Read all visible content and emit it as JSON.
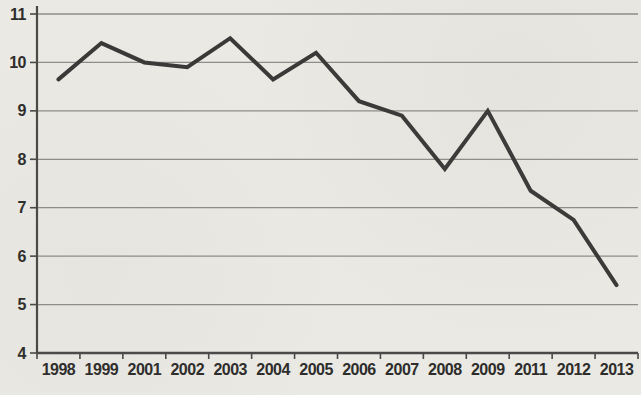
{
  "figure": {
    "background_color": "#eae9e4",
    "gridline_color": "#8e8d89",
    "axis_color": "#4a4947",
    "tick_text_color": "#2e2d2b"
  },
  "chart_data": {
    "type": "line",
    "title": "",
    "xlabel": "",
    "ylabel": "",
    "categories": [
      "1998",
      "1999",
      "2001",
      "2002",
      "2003",
      "2004",
      "2005",
      "2006",
      "2007",
      "2008",
      "2009",
      "2011",
      "2012",
      "2013"
    ],
    "values": [
      9.65,
      10.4,
      10.0,
      9.9,
      10.5,
      9.65,
      10.2,
      9.2,
      8.9,
      7.8,
      9.0,
      7.35,
      6.75,
      5.4
    ],
    "ylim": [
      4,
      11
    ],
    "yticks": [
      4,
      5,
      6,
      7,
      8,
      9,
      10,
      11
    ],
    "grid": true,
    "legend_position": "none",
    "line_color": "#3a3938",
    "line_width": 4
  }
}
